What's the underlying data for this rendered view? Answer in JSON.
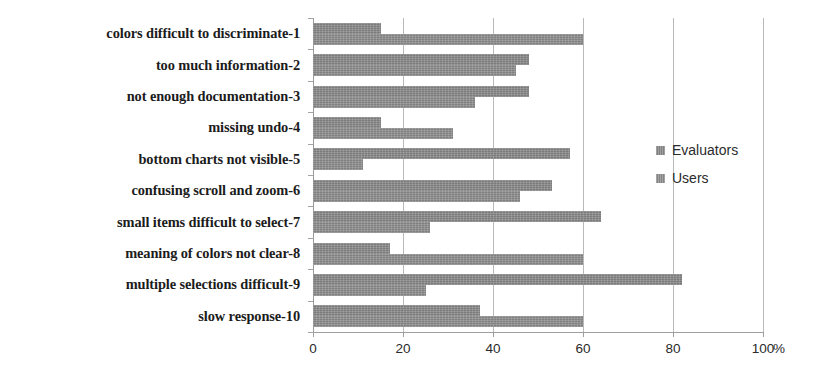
{
  "chart_data": {
    "type": "bar",
    "orientation": "horizontal",
    "title": "",
    "subtitle": "",
    "xlabel": "%",
    "ylabel": "",
    "xlim": [
      0,
      100
    ],
    "xticks": [
      0,
      20,
      40,
      60,
      80,
      100
    ],
    "xtick_labels": [
      "0",
      "20",
      "40",
      "60",
      "80",
      "100"
    ],
    "x_unit_suffix": "%",
    "grid": true,
    "grid_axis": "x",
    "legend_position": "right-middle",
    "categories": [
      "colors difficult to discriminate-1",
      "too much information-2",
      "not enough documentation-3",
      "missing undo-4",
      "bottom charts not visible-5",
      "confusing scroll and zoom-6",
      "small items difficult to select-7",
      "meaning of colors not clear-8",
      "multiple selections difficult-9",
      "slow response-10"
    ],
    "series": [
      {
        "name": "Evaluators",
        "color": "#8a8a8a",
        "values": [
          15,
          48,
          48,
          15,
          57,
          53,
          64,
          17,
          82,
          37
        ]
      },
      {
        "name": "Users",
        "color": "#8f8f8f",
        "values": [
          60,
          45,
          36,
          31,
          11,
          46,
          26,
          60,
          25,
          60
        ]
      }
    ]
  },
  "legend": {
    "items": [
      {
        "label": "Evaluators",
        "swatch_color": "#8a8a8a"
      },
      {
        "label": "Users",
        "swatch_color": "#8f8f8f"
      }
    ]
  },
  "axis": {
    "x_unit": "%",
    "tick_labels": [
      "0",
      "20",
      "40",
      "60",
      "80",
      "100"
    ]
  }
}
